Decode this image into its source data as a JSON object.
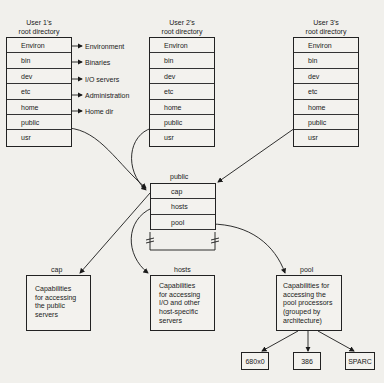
{
  "users": [
    {
      "title_line1": "User 1's",
      "title_line2": "root directory",
      "rows": [
        "Environ",
        "bin",
        "dev",
        "etc",
        "home",
        "public",
        "usr"
      ]
    },
    {
      "title_line1": "User 2's",
      "title_line2": "root directory",
      "rows": [
        "Environ",
        "bin",
        "dev",
        "etc",
        "home",
        "public",
        "usr"
      ]
    },
    {
      "title_line1": "User 3's",
      "title_line2": "root directory",
      "rows": [
        "Environ",
        "bin",
        "dev",
        "etc",
        "home",
        "public",
        "usr"
      ]
    }
  ],
  "user1_annotations": [
    "Environment",
    "Binaries",
    "I/O servers",
    "Administration",
    "Home dir"
  ],
  "public_dir": {
    "title": "public",
    "rows": [
      "cap",
      "hosts",
      "pool"
    ]
  },
  "targets": {
    "cap": {
      "title": "cap",
      "lines": [
        "Capabilities",
        "for accessing",
        "the public",
        "servers"
      ]
    },
    "hosts": {
      "title": "hosts",
      "lines": [
        "Capabilities",
        "for accessing",
        "I/O and other",
        "host-specific",
        "servers"
      ]
    },
    "pool": {
      "title": "pool",
      "lines": [
        "Capabilities for",
        "accessing the",
        "pool processors",
        "(grouped by",
        "architecture)"
      ]
    }
  },
  "architectures": [
    "680x0",
    "386",
    "SPARC"
  ]
}
